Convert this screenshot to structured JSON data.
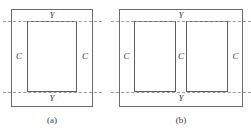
{
  "figure": {
    "type": "technical-diagram",
    "colors": {
      "background": "#ffffff",
      "outer_rect_stroke": "#6b6b6b",
      "inner_rect_stroke": "#5e5e5e",
      "dashed_line_stroke": "#9a9a9a",
      "label_text": "#3a3a3a"
    },
    "panels": [
      {
        "id": "a",
        "caption": "(a)",
        "window_count": 1,
        "labels": {
          "yoke_top": "Y",
          "yoke_bottom": "Y",
          "limb_left": "C",
          "limb_right": "C"
        }
      },
      {
        "id": "b",
        "caption": "(b)",
        "window_count": 2,
        "labels": {
          "yoke_top": "Y",
          "yoke_bottom": "Y",
          "limb_left": "C",
          "limb_middle": "C",
          "limb_right": "C"
        }
      }
    ]
  }
}
